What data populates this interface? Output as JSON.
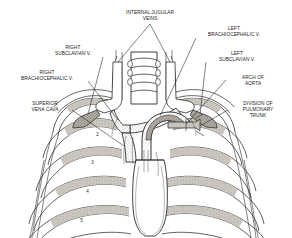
{
  "figure": {
    "background_color": "#ffffff",
    "line_color": "#1b1b1b",
    "shading_color": "#b9b5ae"
  },
  "labels": [
    {
      "id": "internal-jugular-veins",
      "text": "INTERNAL JUGULAR\nVEINS",
      "x": 112,
      "y": 9,
      "width": 76
    },
    {
      "id": "left-brachiocephalic-vein",
      "text": "LEFT\nBRACHIOCEPHALIC V.",
      "x": 196,
      "y": 25,
      "width": 76
    },
    {
      "id": "right-subclavian-vein",
      "text": "RIGHT\nSUBCLAVIAN V.",
      "x": 42,
      "y": 44,
      "width": 62
    },
    {
      "id": "left-subclavian-vein",
      "text": "LEFT\nSUBCLAVIAN V.",
      "x": 206,
      "y": 50,
      "width": 62
    },
    {
      "id": "right-brachiocephalic-vein",
      "text": "RIGHT\nBRACHIOCEPHALIC V.",
      "x": 6,
      "y": 69,
      "width": 82
    },
    {
      "id": "arch-of-aorta",
      "text": "ARCH OF\nAORTA",
      "x": 228,
      "y": 74,
      "width": 50
    },
    {
      "id": "superior-vena-cava",
      "text": "SUPERIOR\nVENA CAVA",
      "x": 18,
      "y": 100,
      "width": 54
    },
    {
      "id": "division-of-pulmonary-trunk",
      "text": "DIVISION OF\nPULMONARY\nTRUNK",
      "x": 230,
      "y": 100,
      "width": 56
    }
  ],
  "rib_numbers": [
    {
      "id": "rib-2",
      "text": "2",
      "x": 96,
      "y": 131
    },
    {
      "id": "rib-3",
      "text": "3",
      "x": 91,
      "y": 159
    },
    {
      "id": "rib-4",
      "text": "4",
      "x": 86,
      "y": 188
    },
    {
      "id": "rib-5",
      "text": "5",
      "x": 80,
      "y": 217
    }
  ]
}
